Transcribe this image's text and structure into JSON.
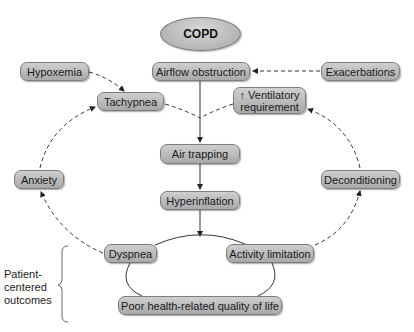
{
  "diagram": {
    "root": {
      "label": "COPD"
    },
    "nodes": {
      "airflow_obstruction": "Airflow obstruction",
      "exacerbations": "Exacerbations",
      "hypoxemia": "Hypoxemia",
      "tachypnea": "Tachypnea",
      "ventilatory_requirement": "↑ Ventilatory requirement",
      "air_trapping": "Air trapping",
      "hyperinflation": "Hyperinflation",
      "anxiety": "Anxiety",
      "deconditioning": "Deconditioning",
      "dyspnea": "Dyspnea",
      "activity_limitation": "Activity limitation",
      "poor_hrqol": "Poor health-related quality of life"
    },
    "group_label": "Patient-centered outcomes",
    "edges": [
      {
        "from": "COPD",
        "to": "Airflow obstruction",
        "style": "none"
      },
      {
        "from": "Exacerbations",
        "to": "Airflow obstruction",
        "style": "dashed"
      },
      {
        "from": "Hypoxemia",
        "to": "Tachypnea",
        "style": "dashed"
      },
      {
        "from": "Airflow obstruction",
        "to": "Air trapping",
        "style": "solid"
      },
      {
        "from": "Air trapping",
        "to": "Hyperinflation",
        "style": "solid"
      },
      {
        "from": "Hyperinflation",
        "to": "Dyspnea/Activity limitation cycle",
        "style": "solid"
      },
      {
        "from": "Dyspnea",
        "to": "Anxiety",
        "style": "dashed"
      },
      {
        "from": "Anxiety",
        "to": "Tachypnea",
        "style": "dashed"
      },
      {
        "from": "Tachypnea",
        "to": "Airflow obstruction line",
        "style": "dashed"
      },
      {
        "from": "Activity limitation",
        "to": "Deconditioning",
        "style": "dashed"
      },
      {
        "from": "Deconditioning",
        "to": "↑ Ventilatory requirement",
        "style": "dashed"
      },
      {
        "from": "↑ Ventilatory requirement",
        "to": "Airflow obstruction line",
        "style": "dashed"
      },
      {
        "from": "Dyspnea",
        "to": "Activity limitation",
        "style": "cycle"
      },
      {
        "from": "Activity limitation",
        "to": "Poor health-related quality of life",
        "style": "cycle"
      },
      {
        "from": "Poor health-related quality of life",
        "to": "Dyspnea",
        "style": "cycle"
      }
    ],
    "colors": {
      "node_fill_top": "#cfcfcf",
      "node_fill_bottom": "#a9a9a9",
      "border": "#7d7d7d",
      "line": "#333333"
    }
  }
}
